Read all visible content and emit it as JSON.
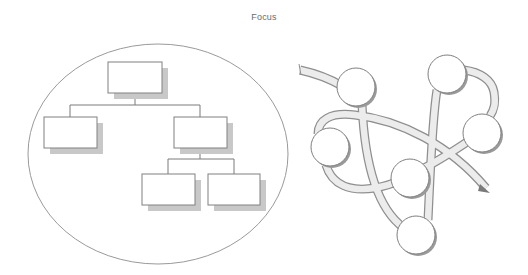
{
  "title": "Focus",
  "colors": {
    "stroke": "#8a8a8a",
    "shadow": "#c4c4c4",
    "ribbon_fill": "#ececec",
    "ribbon_stroke": "#8f8f8f",
    "circle_fill": "#ffffff",
    "circle_shadow": "#9a9a9a",
    "ellipse_stroke": "#9a9a9a"
  },
  "left_diagram": {
    "label": "hierarchy-tree",
    "ellipse": {
      "cx": 158,
      "cy": 154,
      "rx": 130,
      "ry": 110
    },
    "boxes": [
      {
        "id": "root",
        "x": 108,
        "y": 62,
        "w": 54,
        "h": 31
      },
      {
        "id": "child-left",
        "x": 44,
        "y": 117,
        "w": 53,
        "h": 31
      },
      {
        "id": "child-right",
        "x": 174,
        "y": 117,
        "w": 53,
        "h": 31
      },
      {
        "id": "grandchild-left",
        "x": 142,
        "y": 174,
        "w": 53,
        "h": 31
      },
      {
        "id": "grandchild-right",
        "x": 208,
        "y": 174,
        "w": 52,
        "h": 31
      }
    ]
  },
  "right_diagram": {
    "label": "network-ribbon",
    "nodes": [
      {
        "id": "n1",
        "cx": 356,
        "cy": 87,
        "r": 19
      },
      {
        "id": "n2",
        "cx": 447,
        "cy": 74,
        "r": 19
      },
      {
        "id": "n3",
        "cx": 482,
        "cy": 133,
        "r": 19
      },
      {
        "id": "n4",
        "cx": 330,
        "cy": 147,
        "r": 19
      },
      {
        "id": "n5",
        "cx": 410,
        "cy": 178,
        "r": 19
      },
      {
        "id": "n6",
        "cx": 416,
        "cy": 235,
        "r": 19
      }
    ]
  }
}
